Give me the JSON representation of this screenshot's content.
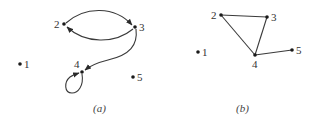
{
  "figure": {
    "graphs": [
      {
        "id": "a",
        "caption": "(a)",
        "directed": true,
        "nodes": [
          {
            "id": "1",
            "label": "1",
            "x": 20,
            "y": 64,
            "label_dx": 4,
            "label_dy": 4
          },
          {
            "id": "2",
            "label": "2",
            "x": 64,
            "y": 24,
            "label_dx": -10,
            "label_dy": 4
          },
          {
            "id": "3",
            "label": "3",
            "x": 135,
            "y": 27,
            "label_dx": 4,
            "label_dy": 4
          },
          {
            "id": "4",
            "label": "4",
            "x": 82,
            "y": 72,
            "label_dx": -8,
            "label_dy": -4
          },
          {
            "id": "5",
            "label": "5",
            "x": 133,
            "y": 77,
            "label_dx": 4,
            "label_dy": 4
          }
        ],
        "edges": [
          {
            "from": "2",
            "to": "3",
            "style": "arc-top"
          },
          {
            "from": "3",
            "to": "2",
            "style": "arc-bottom"
          },
          {
            "from": "3",
            "to": "4",
            "style": "curve"
          },
          {
            "from": "4",
            "to": "4",
            "style": "self-loop"
          }
        ]
      },
      {
        "id": "b",
        "caption": "(b)",
        "directed": false,
        "nodes": [
          {
            "id": "1",
            "label": "1",
            "x": 198,
            "y": 52,
            "label_dx": 4,
            "label_dy": 4
          },
          {
            "id": "2",
            "label": "2",
            "x": 221,
            "y": 15,
            "label_dx": -10,
            "label_dy": 4
          },
          {
            "id": "3",
            "label": "3",
            "x": 267,
            "y": 17,
            "label_dx": 4,
            "label_dy": 4
          },
          {
            "id": "4",
            "label": "4",
            "x": 255,
            "y": 55,
            "label_dx": -3,
            "label_dy": 13
          },
          {
            "id": "5",
            "label": "5",
            "x": 292,
            "y": 50,
            "label_dx": 4,
            "label_dy": 4
          }
        ],
        "edges": [
          {
            "from": "2",
            "to": "3"
          },
          {
            "from": "2",
            "to": "4"
          },
          {
            "from": "3",
            "to": "4"
          },
          {
            "from": "4",
            "to": "5"
          }
        ]
      }
    ],
    "colors": {
      "node": "#1a1a1a",
      "edge": "#3a3a3a",
      "text": "#333333"
    }
  }
}
